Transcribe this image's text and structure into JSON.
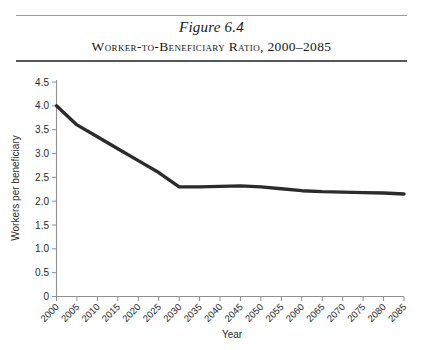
{
  "figure": {
    "number": "Figure 6.4",
    "caption": "Worker-to-Beneficiary Ratio, 2000–2085"
  },
  "chart_data": {
    "type": "line",
    "title": "Worker-to-Beneficiary Ratio, 2000–2085",
    "xlabel": "Year",
    "ylabel": "Workers per beneficiary",
    "xlim": [
      2000,
      2085
    ],
    "ylim": [
      0,
      4.5
    ],
    "grid": false,
    "legend": "none",
    "line_color": "#2b2b2d",
    "categories": [
      "2000",
      "2005",
      "2010",
      "2015",
      "2020",
      "2025",
      "2030",
      "2035",
      "2040",
      "2045",
      "2050",
      "2055",
      "2060",
      "2065",
      "2070",
      "2075",
      "2080",
      "2085"
    ],
    "x": [
      2000,
      2005,
      2010,
      2015,
      2020,
      2025,
      2030,
      2035,
      2040,
      2045,
      2050,
      2055,
      2060,
      2065,
      2070,
      2075,
      2080,
      2085
    ],
    "values": [
      4.0,
      3.6,
      3.35,
      3.1,
      2.85,
      2.6,
      2.3,
      2.3,
      2.31,
      2.32,
      2.3,
      2.26,
      2.22,
      2.2,
      2.19,
      2.18,
      2.17,
      2.15
    ],
    "ytick_labels": [
      "0",
      "0.5",
      "1.0",
      "1.5",
      "2.0",
      "2.5",
      "3.0",
      "3.5",
      "4.0",
      "4.5"
    ],
    "ytick_values": [
      0,
      0.5,
      1.0,
      1.5,
      2.0,
      2.5,
      3.0,
      3.5,
      4.0,
      4.5
    ]
  }
}
